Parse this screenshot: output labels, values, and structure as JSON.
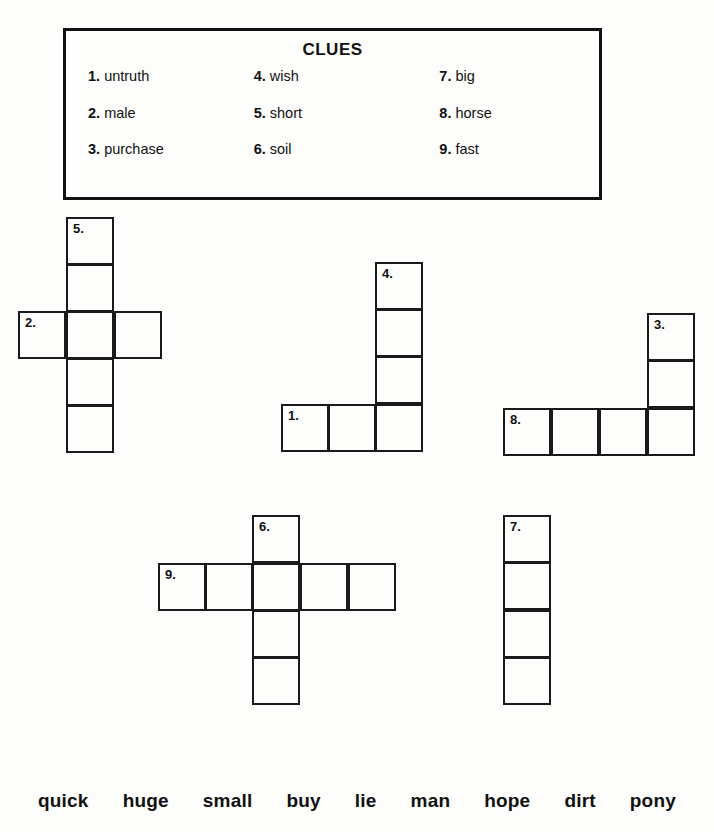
{
  "worksheet": {
    "cell_size": 48
  },
  "clues": {
    "title": "CLUES",
    "columns": [
      {
        "items": [
          {
            "num": "1.",
            "word": "untruth"
          },
          {
            "num": "2.",
            "word": "male"
          },
          {
            "num": "3.",
            "word": "purchase"
          }
        ]
      },
      {
        "items": [
          {
            "num": "4.",
            "word": "wish"
          },
          {
            "num": "5.",
            "word": "short"
          },
          {
            "num": "6.",
            "word": "soil"
          }
        ]
      },
      {
        "items": [
          {
            "num": "7.",
            "word": "big"
          },
          {
            "num": "8.",
            "word": "horse"
          },
          {
            "num": "9.",
            "word": "fast"
          }
        ]
      }
    ]
  },
  "grids": [
    {
      "id": "grid-cross-5-2",
      "cells": [
        {
          "x": 66,
          "y": 217,
          "num": "5."
        },
        {
          "x": 66,
          "y": 264,
          "num": ""
        },
        {
          "x": 18,
          "y": 311,
          "num": "2."
        },
        {
          "x": 66,
          "y": 311,
          "num": ""
        },
        {
          "x": 114,
          "y": 311,
          "num": ""
        },
        {
          "x": 66,
          "y": 358,
          "num": ""
        },
        {
          "x": 66,
          "y": 405,
          "num": ""
        }
      ]
    },
    {
      "id": "grid-L-4-1",
      "cells": [
        {
          "x": 375,
          "y": 262,
          "num": "4."
        },
        {
          "x": 375,
          "y": 309,
          "num": ""
        },
        {
          "x": 375,
          "y": 356,
          "num": ""
        },
        {
          "x": 281,
          "y": 404,
          "num": "1."
        },
        {
          "x": 328,
          "y": 404,
          "num": ""
        },
        {
          "x": 375,
          "y": 404,
          "num": ""
        }
      ]
    },
    {
      "id": "grid-L-3-8",
      "cells": [
        {
          "x": 647,
          "y": 313,
          "num": "3."
        },
        {
          "x": 647,
          "y": 360,
          "num": ""
        },
        {
          "x": 503,
          "y": 408,
          "num": "8."
        },
        {
          "x": 551,
          "y": 408,
          "num": ""
        },
        {
          "x": 599,
          "y": 408,
          "num": ""
        },
        {
          "x": 647,
          "y": 408,
          "num": ""
        }
      ]
    },
    {
      "id": "grid-cross-6-9",
      "cells": [
        {
          "x": 252,
          "y": 515,
          "num": "6."
        },
        {
          "x": 158,
          "y": 563,
          "num": "9."
        },
        {
          "x": 205,
          "y": 563,
          "num": ""
        },
        {
          "x": 252,
          "y": 563,
          "num": ""
        },
        {
          "x": 300,
          "y": 563,
          "num": ""
        },
        {
          "x": 348,
          "y": 563,
          "num": ""
        },
        {
          "x": 252,
          "y": 610,
          "num": ""
        },
        {
          "x": 252,
          "y": 657,
          "num": ""
        }
      ]
    },
    {
      "id": "grid-column-7",
      "cells": [
        {
          "x": 503,
          "y": 515,
          "num": "7."
        },
        {
          "x": 503,
          "y": 562,
          "num": ""
        },
        {
          "x": 503,
          "y": 610,
          "num": ""
        },
        {
          "x": 503,
          "y": 657,
          "num": ""
        }
      ]
    }
  ],
  "word_bank": {
    "words": [
      "quick",
      "huge",
      "small",
      "buy",
      "lie",
      "man",
      "hope",
      "dirt",
      "pony"
    ]
  }
}
